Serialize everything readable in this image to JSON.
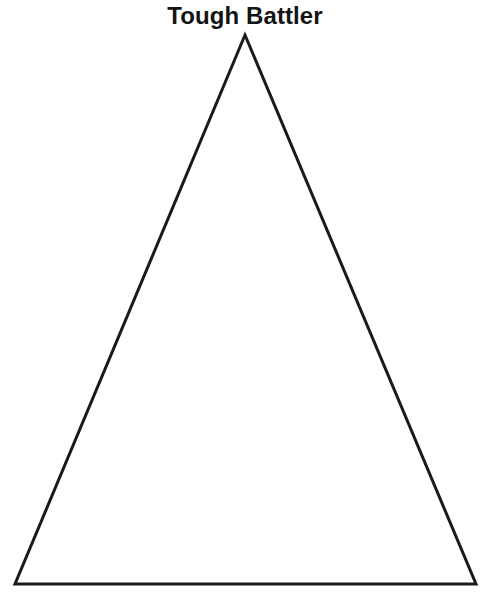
{
  "canvas": {
    "width": 490,
    "height": 599,
    "background_color": "#ffffff"
  },
  "header": {
    "title": "Tough Battler"
  },
  "diagram": {
    "name": "triangle-outline",
    "shape": "triangle",
    "fill": "none",
    "stroke_color": "#1a1a1a",
    "stroke_width": 3,
    "points": "245,35 476,584 15,584",
    "vertices": [
      {
        "label": "apex",
        "x": 245,
        "y": 35
      },
      {
        "label": "bottom-right",
        "x": 476,
        "y": 584
      },
      {
        "label": "bottom-left",
        "x": 15,
        "y": 584
      }
    ]
  }
}
